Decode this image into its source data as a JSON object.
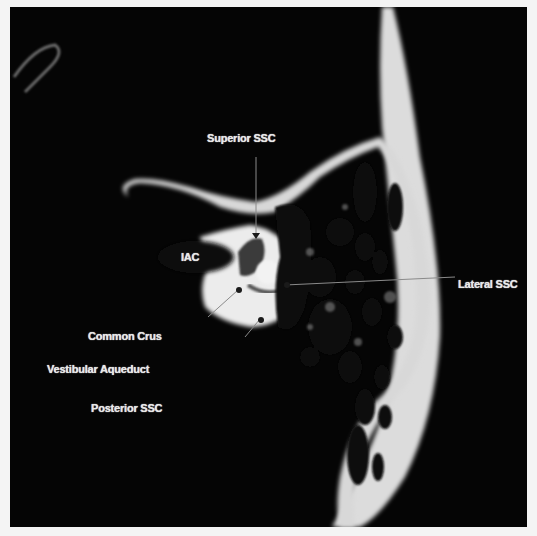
{
  "figure": {
    "type": "axial CT scan of temporal bone",
    "background_color": "#050505",
    "bone_color": "#e6e6e6",
    "label_color": "#e8e8e8"
  },
  "labels": {
    "superior_ssc": "Superior SSC",
    "iac": "IAC",
    "lateral_ssc": "Lateral SSC",
    "common_crus": "Common Crus",
    "vestibular_aqueduct": "Vestibular Aqueduct",
    "posterior_ssc": "Posterior SSC"
  }
}
